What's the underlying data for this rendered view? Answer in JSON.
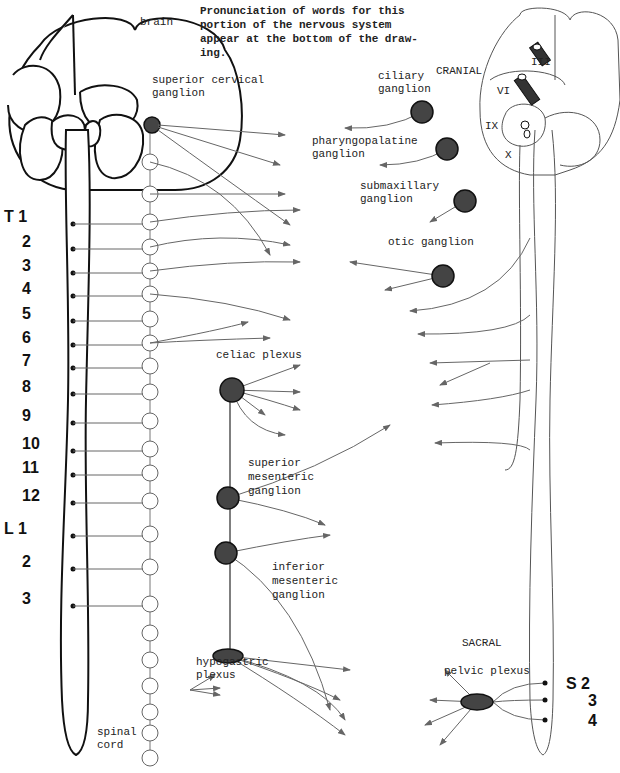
{
  "caption": [
    "Pronunciation of words for this",
    "portion of the nervous system",
    "appear at the bottom of the draw-",
    "ing."
  ],
  "labels": {
    "brain": "brain",
    "superior_cervical": [
      "superior cervical",
      "ganglion"
    ],
    "celiac": "celiac plexus",
    "superior_mesenteric": [
      "superior",
      "mesenteric",
      "ganglion"
    ],
    "inferior_mesenteric": [
      "inferior",
      "mesenteric",
      "ganglion"
    ],
    "hypogastric": [
      "hypogastric",
      "plexus"
    ],
    "spinal_cord": [
      "spinal",
      "cord"
    ],
    "cranial": "CRANIAL",
    "ciliary": [
      "ciliary",
      "ganglion"
    ],
    "pharyngopalatine": [
      "pharyngopalatine",
      "ganglion"
    ],
    "submaxillary": [
      "submaxillary",
      "ganglion"
    ],
    "otic": "otic ganglion",
    "sacral": "SACRAL",
    "pelvic": "pelvic plexus",
    "cranial_nerves": [
      "III",
      "VI",
      "IX",
      "X"
    ]
  },
  "segments": {
    "thoracic": [
      "T 1",
      "2",
      "3",
      "4",
      "5",
      "6",
      "7",
      "8",
      "9",
      "10",
      "11",
      "12"
    ],
    "lumbar": [
      "L 1",
      "2",
      "3"
    ],
    "sacral": [
      "S 2",
      "3",
      "4"
    ]
  },
  "colors": {
    "ganglion": "#444444",
    "nerve": "#666666",
    "outline": "#111111"
  }
}
